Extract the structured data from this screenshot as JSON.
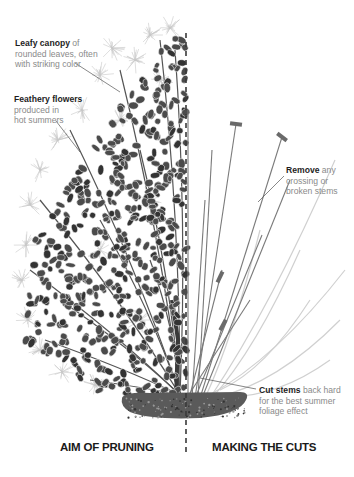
{
  "diagram": {
    "divider": {
      "x": 186,
      "y_start": 33,
      "y_end": 452,
      "color": "#3a3a3a"
    },
    "left_section": {
      "title": "AIM OF PRUNING",
      "callouts": [
        {
          "bold": "Leafy canopy",
          "rest_lines": [
            " of",
            "rounded leaves, often",
            "with striking color"
          ],
          "x": 15,
          "y": 38,
          "leader": [
            75,
            63,
            120,
            92
          ]
        },
        {
          "bold": "Feathery flowers",
          "rest_lines": [
            "",
            "produced in",
            "hot summers"
          ],
          "x": 14,
          "y": 94,
          "leader": [
            56,
            121,
            80,
            152
          ]
        }
      ]
    },
    "right_section": {
      "title": "MAKING THE CUTS",
      "callouts": [
        {
          "bold": "Remove",
          "rest_lines": [
            " any",
            "crossing or",
            "broken stems"
          ],
          "x": 286,
          "y": 165,
          "leader": [
            284,
            176,
            258,
            202
          ]
        },
        {
          "bold": "Cut stems",
          "rest_lines": [
            " back hard",
            "for the best summer",
            "foliage effect"
          ],
          "x": 259,
          "y": 385,
          "leader": [
            256,
            389,
            200,
            378
          ]
        }
      ],
      "cut_markers": [
        {
          "x": 236,
          "y": 124,
          "angle": 8
        },
        {
          "x": 282,
          "y": 137,
          "angle": 38
        },
        {
          "x": 220,
          "y": 277,
          "angle": -65
        },
        {
          "x": 223,
          "y": 325,
          "angle": -62
        }
      ]
    },
    "colors": {
      "leaf": "#4b4b4b",
      "leaf_dark": "#333333",
      "plume": "#c9c9c9",
      "stem_dark": "#7a7a7a",
      "stem_light": "#d0d0d0",
      "soil": "#5a5a5a",
      "marker": "#6a6a6a"
    }
  }
}
